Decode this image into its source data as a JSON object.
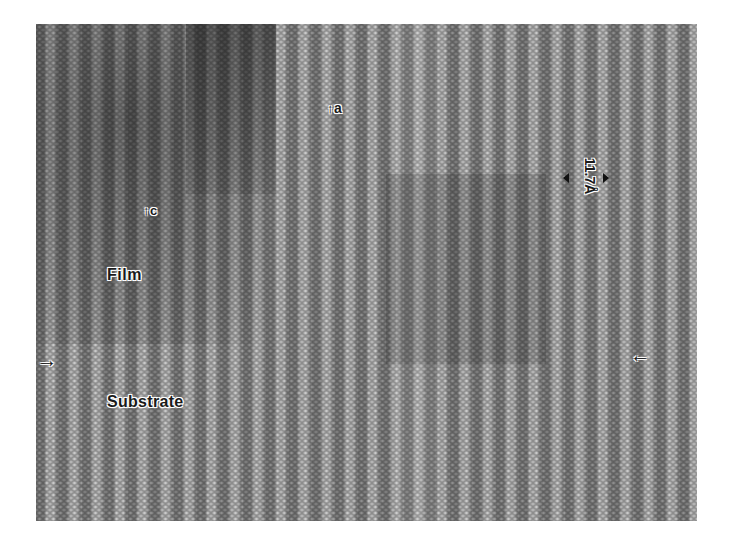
{
  "figure": {
    "type": "HRTEM lattice image",
    "labels": {
      "a_axis": "a",
      "c_axis": "c",
      "film": "Film",
      "substrate": "Substrate",
      "spacing": "11.7Å"
    },
    "icons": {
      "up_arrow": "↑",
      "interface_arrow_left": "→",
      "interface_arrow_right": "←"
    },
    "colors": {
      "background": "#ffffff",
      "micrograph_mid": "#7d7d7d",
      "label_text": "#1a1a1a"
    }
  }
}
